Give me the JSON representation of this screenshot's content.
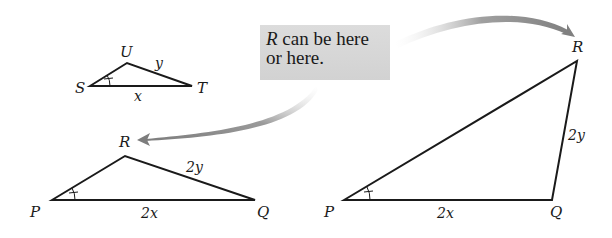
{
  "callout": {
    "var": "R",
    "line1_rest": " can be here",
    "line2": "or here."
  },
  "small_triangle": {
    "vertices": {
      "S": "S",
      "U": "U",
      "T": "T"
    },
    "sides": {
      "UT": "y",
      "ST": "x"
    }
  },
  "left_triangle": {
    "vertices": {
      "P": "P",
      "R": "R",
      "Q": "Q"
    },
    "sides": {
      "RQ": "2y",
      "PQ": "2x"
    }
  },
  "right_triangle": {
    "vertices": {
      "P": "P",
      "R": "R",
      "Q": "Q"
    },
    "sides": {
      "RQ": "2y",
      "PQ": "2x"
    }
  },
  "colors": {
    "line": "#1a1a1a",
    "arrow": "#8a8a8a",
    "callout_bg": "#d6d6d6"
  }
}
